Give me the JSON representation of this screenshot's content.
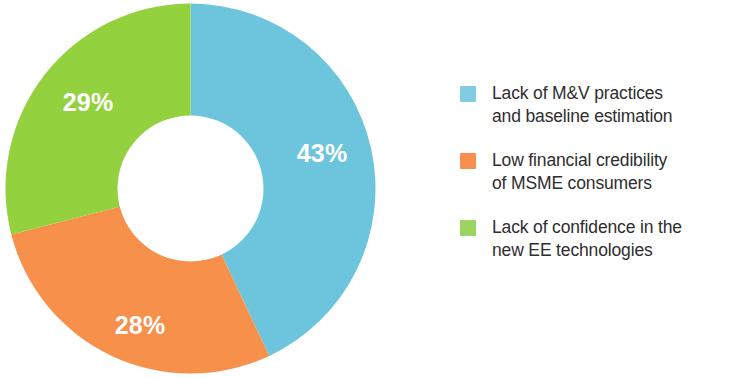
{
  "chart_data": {
    "type": "pie",
    "variant": "donut",
    "title": "",
    "subtitle": "",
    "xlabel": "",
    "ylabel": "",
    "legend_position": "right",
    "grid": false,
    "start_angle_deg": 0,
    "direction": "clockwise",
    "inner_radius_ratio": 0.395,
    "categories": [
      "Lack of M&V practices and baseline estimation",
      "Low financial credibility of MSME consumers",
      "Lack of confidence in the new EE technologies"
    ],
    "values": [
      43,
      28,
      29
    ],
    "value_unit": "%",
    "data_labels": [
      "43%",
      "28%",
      "29%"
    ],
    "colors": [
      "#6CC5DD",
      "#F6904A",
      "#93D13F"
    ]
  },
  "donut": {
    "slices": [
      {
        "id": "slice-mv-practices",
        "label": "43%",
        "value": 43,
        "color": "#6CC5DD",
        "label_x": 322,
        "label_y": 153
      },
      {
        "id": "slice-financial-credibility",
        "label": "28%",
        "value": 28,
        "color": "#F6904A",
        "label_x": 140,
        "label_y": 325
      },
      {
        "id": "slice-confidence-ee",
        "label": "29%",
        "value": 29,
        "color": "#93D13F",
        "label_x": 88,
        "label_y": 102
      }
    ]
  },
  "legend": {
    "items": [
      {
        "color": "#7FCDE3",
        "line1": "Lack of M&V practices",
        "line2": "and baseline estimation",
        "text": "Lack of M&V practices\nand baseline estimation"
      },
      {
        "color": "#F6904A",
        "line1": "Low financial credibility",
        "line2": "of MSME consumers",
        "text": "Low financial credibility\nof MSME consumers"
      },
      {
        "color": "#9BD45F",
        "line1": "Lack of confidence in the",
        "line2": "new EE technologies",
        "text": "Lack of confidence in the\nnew EE technologies"
      }
    ]
  }
}
